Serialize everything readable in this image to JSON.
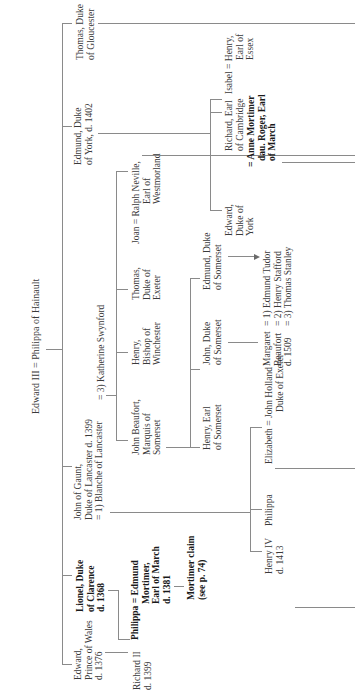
{
  "title": "Edward III = Philippa of Hainault",
  "orientation": "rotated-90-ccw",
  "generation1": [
    {
      "id": "edward-black-prince",
      "lines": [
        "Edward,",
        "Prince of Wales",
        "d. 1376"
      ],
      "bold": false
    },
    {
      "id": "lionel",
      "lines": [
        "Lionel, Duke",
        "of Clarence",
        "d. 1368"
      ],
      "bold": true
    },
    {
      "id": "john-of-gaunt",
      "lines": [
        "John of Gaunt,",
        "Duke of Lancaster d. 1399",
        "= 1) Blanche of Lancaster"
      ],
      "bold": false
    },
    {
      "id": "edmund-york",
      "lines": [
        "Edmund, Duke",
        "of York, d. 1402"
      ],
      "bold": false
    },
    {
      "id": "thomas-gloucester",
      "lines": [
        "Thomas, Duke",
        "of Gloucester"
      ],
      "bold": false
    }
  ],
  "katherine": "= 3) Katherine Swynford",
  "generation2": {
    "richard2": [
      "Richard II",
      "d. 1399"
    ],
    "philippa_mortimer": [
      "Philippa = Edmund",
      "Mortimer,",
      "Earl of March",
      "d. 1381"
    ],
    "mortimer_claim": [
      "Mortimer claim",
      "(see p. 74)"
    ],
    "john_beaufort": [
      "John Beaufort,",
      "Marquis of",
      "Somerset"
    ],
    "henry_bishop": [
      "Henry,",
      "Bishop of",
      "Winchester"
    ],
    "thomas_exeter": [
      "Thomas,",
      "Duke of",
      "Exeter"
    ],
    "joan_neville": [
      "Joan = Ralph Neville,",
      "Earl of",
      "Westmorland"
    ],
    "richard_cambridge": [
      "Richard, Earl",
      "of Cambridge"
    ],
    "anne_mortimer": [
      "= Anne Mortimer",
      "dau. Roger, Earl",
      "of March"
    ],
    "isabel_henry": [
      "Isabel = Henry,",
      "Earl of",
      "Essex"
    ]
  },
  "generation3": {
    "henry_somerset": [
      "Henry, Earl",
      "of Somerset"
    ],
    "john_somerset": [
      "John, Duke",
      "of Somerset"
    ],
    "edmund_somerset": [
      "Edmund, Duke",
      "of Somerset"
    ],
    "edward_york": [
      "Edward,",
      "Duke of",
      "York"
    ],
    "henry4": [
      "Henry IV",
      "d. 1413"
    ],
    "philippa": [
      "Philippa"
    ],
    "elizabeth_holland": [
      "Elizabeth = John Holland",
      "Duke of Exeter"
    ],
    "margaret_beaufort": [
      "Margaret",
      "Beaufort",
      "d. 1509"
    ],
    "margaret_spouses": [
      "= 1) Edmund Tudor",
      "= 2) Henry Stafford",
      "= 3) Thomas Stanley"
    ]
  }
}
